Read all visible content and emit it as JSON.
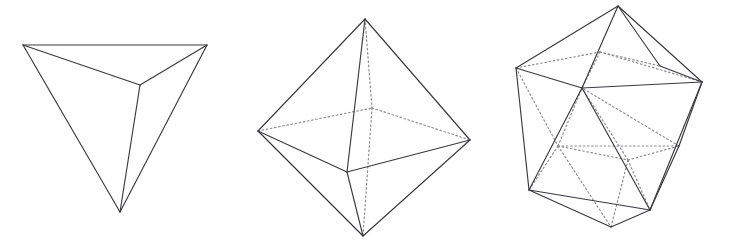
{
  "figure": {
    "background_color": "#ffffff",
    "visible_edge_color": "#3a3a40",
    "hidden_edge_color": "#8a8a93",
    "width": 733,
    "height": 250,
    "solids": [
      {
        "name": "tetrahedron",
        "label": "Tetrahedron",
        "faces": 4,
        "vertices_count": 4,
        "edges_count": 6,
        "vertices": {
          "top_left": [
            23,
            45
          ],
          "top_right": [
            207,
            45
          ],
          "center": [
            140,
            85
          ],
          "bottom": [
            120,
            212
          ]
        },
        "visible_edges": [
          [
            [
              23,
              45
            ],
            [
              207,
              45
            ]
          ],
          [
            [
              23,
              45
            ],
            [
              140,
              85
            ]
          ],
          [
            [
              207,
              45
            ],
            [
              140,
              85
            ]
          ],
          [
            [
              23,
              45
            ],
            [
              120,
              212
            ]
          ],
          [
            [
              207,
              45
            ],
            [
              120,
              212
            ]
          ],
          [
            [
              140,
              85
            ],
            [
              120,
              212
            ]
          ]
        ],
        "hidden_edges": []
      },
      {
        "name": "octahedron",
        "label": "Octahedron",
        "faces": 8,
        "vertices_count": 6,
        "edges_count": 12,
        "vertices": {
          "top": [
            365,
            19
          ],
          "bottom": [
            363,
            236
          ],
          "left": [
            258,
            131
          ],
          "right": [
            470,
            140
          ],
          "front": [
            347,
            172
          ],
          "back": [
            372,
            108
          ]
        },
        "visible_edges": [
          [
            [
              365,
              19
            ],
            [
              258,
              131
            ]
          ],
          [
            [
              365,
              19
            ],
            [
              470,
              140
            ]
          ],
          [
            [
              365,
              19
            ],
            [
              347,
              172
            ]
          ],
          [
            [
              258,
              131
            ],
            [
              363,
              236
            ]
          ],
          [
            [
              470,
              140
            ],
            [
              363,
              236
            ]
          ],
          [
            [
              347,
              172
            ],
            [
              363,
              236
            ]
          ],
          [
            [
              258,
              131
            ],
            [
              347,
              172
            ]
          ],
          [
            [
              347,
              172
            ],
            [
              470,
              140
            ]
          ]
        ],
        "hidden_edges": [
          [
            [
              365,
              19
            ],
            [
              372,
              108
            ]
          ],
          [
            [
              372,
              108
            ],
            [
              363,
              236
            ]
          ],
          [
            [
              258,
              131
            ],
            [
              372,
              108
            ]
          ],
          [
            [
              372,
              108
            ],
            [
              470,
              140
            ]
          ]
        ]
      },
      {
        "name": "icosahedron",
        "label": "Icosahedron",
        "faces": 20,
        "vertices_count": 12,
        "edges_count": 30,
        "vertices": {
          "top": [
            618,
            6
          ],
          "bottom": [
            611,
            227
          ],
          "upper_left": [
            516,
            68
          ],
          "upper_mid_left": [
            582,
            88
          ],
          "upper_right": [
            702,
            82
          ],
          "upper_mid_right": [
            660,
            66
          ],
          "upper_back": [
            600,
            52
          ],
          "lower_left": [
            529,
            190
          ],
          "lower_mid_left": [
            558,
            146
          ],
          "lower_right": [
            650,
            210
          ],
          "lower_mid_right": [
            679,
            146
          ],
          "lower_back": [
            628,
            160
          ]
        },
        "visible_edges": [
          [
            [
              618,
              6
            ],
            [
              516,
              68
            ]
          ],
          [
            [
              618,
              6
            ],
            [
              702,
              82
            ]
          ],
          [
            [
              618,
              6
            ],
            [
              582,
              88
            ]
          ],
          [
            [
              618,
              6
            ],
            [
              660,
              66
            ]
          ],
          [
            [
              516,
              68
            ],
            [
              582,
              88
            ]
          ],
          [
            [
              582,
              88
            ],
            [
              702,
              82
            ]
          ],
          [
            [
              516,
              68
            ],
            [
              529,
              190
            ]
          ],
          [
            [
              702,
              82
            ],
            [
              650,
              210
            ]
          ],
          [
            [
              582,
              88
            ],
            [
              529,
              190
            ]
          ],
          [
            [
              582,
              88
            ],
            [
              650,
              210
            ]
          ],
          [
            [
              529,
              190
            ],
            [
              650,
              210
            ]
          ],
          [
            [
              529,
              190
            ],
            [
              611,
              227
            ]
          ],
          [
            [
              650,
              210
            ],
            [
              611,
              227
            ]
          ],
          [
            [
              702,
              82
            ],
            [
              679,
              146
            ]
          ],
          [
            [
              679,
              146
            ],
            [
              650,
              210
            ]
          ],
          [
            [
              660,
              66
            ],
            [
              702,
              82
            ]
          ]
        ],
        "hidden_edges": [
          [
            [
              516,
              68
            ],
            [
              600,
              52
            ]
          ],
          [
            [
              600,
              52
            ],
            [
              660,
              66
            ]
          ],
          [
            [
              600,
              52
            ],
            [
              702,
              82
            ]
          ],
          [
            [
              600,
              52
            ],
            [
              582,
              88
            ]
          ],
          [
            [
              516,
              68
            ],
            [
              558,
              146
            ]
          ],
          [
            [
              558,
              146
            ],
            [
              529,
              190
            ]
          ],
          [
            [
              558,
              146
            ],
            [
              582,
              88
            ]
          ],
          [
            [
              558,
              146
            ],
            [
              628,
              160
            ]
          ],
          [
            [
              628,
              160
            ],
            [
              582,
              88
            ]
          ],
          [
            [
              628,
              160
            ],
            [
              679,
              146
            ]
          ],
          [
            [
              628,
              160
            ],
            [
              650,
              210
            ]
          ],
          [
            [
              628,
              160
            ],
            [
              611,
              227
            ]
          ],
          [
            [
              558,
              146
            ],
            [
              611,
              227
            ]
          ],
          [
            [
              679,
              146
            ],
            [
              582,
              88
            ]
          ],
          [
            [
              558,
              146
            ],
            [
              679,
              146
            ]
          ]
        ]
      }
    ]
  }
}
